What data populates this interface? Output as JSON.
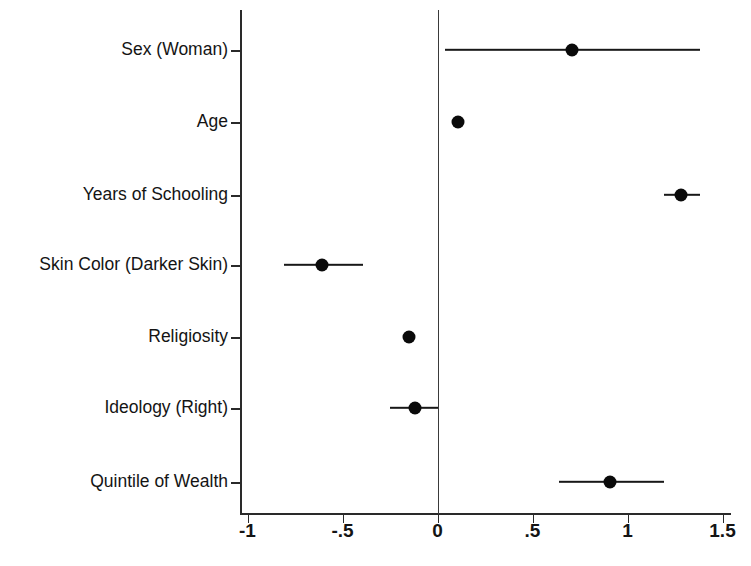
{
  "chart_data": {
    "type": "scatter",
    "title": "",
    "subtitle": "",
    "xlabel": "",
    "ylabel": "",
    "xlim": [
      -1.0375,
      1.5475
    ],
    "xticks": [
      -1,
      -0.5,
      0,
      0.5,
      1,
      1.5
    ],
    "xticklabels": [
      "-1",
      "-.5",
      "0",
      ".5",
      "1",
      "1.5"
    ],
    "grid": false,
    "legend": "none",
    "reference_line": 0,
    "categories": [
      "Sex (Woman)",
      "Age",
      "Years of Schooling",
      "Skin Color (Darker Skin)",
      "Religiosity",
      "Ideology (Right)",
      "Quintile of Wealth"
    ],
    "series": [
      {
        "name": "Coefficient",
        "values": [
          0.71,
          0.11,
          1.28,
          -0.61,
          -0.15,
          -0.12,
          0.91
        ],
        "ci_low": [
          0.04,
          0.09,
          1.19,
          -0.81,
          -0.17,
          -0.25,
          0.64
        ],
        "ci_high": [
          1.38,
          0.13,
          1.38,
          -0.39,
          -0.13,
          0.0,
          1.19
        ]
      }
    ],
    "marker_color": "#0a0a0a",
    "line_color": "#181818",
    "axis_color": "#2a2a2a",
    "background_color": "#ffffff"
  },
  "axis": {
    "x_tick_labels": [
      "-1",
      "-.5",
      "0",
      ".5",
      "1",
      "1.5"
    ],
    "y_tick_labels": [
      "Sex (Woman)",
      "Age",
      "Years of Schooling",
      "Skin Color (Darker Skin)",
      "Religiosity",
      "Ideology (Right)",
      "Quintile of Wealth"
    ]
  },
  "rows": [
    {
      "label": "Sex (Woman)",
      "estimate": 0.71,
      "low": 0.04,
      "high": 1.38
    },
    {
      "label": "Age",
      "estimate": 0.11,
      "low": 0.09,
      "high": 0.13
    },
    {
      "label": "Years of Schooling",
      "estimate": 1.28,
      "low": 1.19,
      "high": 1.38
    },
    {
      "label": "Skin Color (Darker Skin)",
      "estimate": -0.61,
      "low": -0.81,
      "high": -0.39
    },
    {
      "label": "Religiosity",
      "estimate": -0.15,
      "low": -0.17,
      "high": -0.13
    },
    {
      "label": "Ideology (Right)",
      "estimate": -0.12,
      "low": -0.25,
      "high": 0.0
    },
    {
      "label": "Quintile of Wealth",
      "estimate": 0.91,
      "low": 0.64,
      "high": 1.19
    }
  ]
}
